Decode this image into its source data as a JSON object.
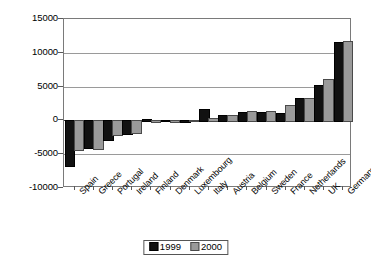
{
  "chart_data": {
    "type": "bar",
    "title": "",
    "subtitle": "",
    "xlabel": "",
    "ylabel": "",
    "ylim": [
      -10000,
      15000
    ],
    "yticks": [
      15000,
      10000,
      5000,
      0,
      -5000,
      -10000
    ],
    "ytick_labels": [
      "15000",
      "10000",
      "5000",
      "0",
      "-5000",
      "-10000"
    ],
    "grid": true,
    "legend_position": "bottom-center",
    "orientation": "vertical",
    "categories": [
      "Spain",
      "Greece",
      "Portugal",
      "Ireland",
      "Finland",
      "Denmark",
      "Luxembourg",
      "Italy",
      "Austria",
      "Belgium",
      "Sweden",
      "France",
      "Netherlands",
      "UK",
      "Germany"
    ],
    "series": [
      {
        "name": "1999",
        "color": "#111111",
        "values": [
          -6550,
          -4000,
          -2700,
          -1800,
          250,
          100,
          80,
          1700,
          800,
          1300,
          1250,
          1150,
          3300,
          5300,
          11550
        ]
      },
      {
        "name": "2000",
        "color": "#9a9a9a",
        "values": [
          -4300,
          -4150,
          -2000,
          -1700,
          -150,
          -60,
          120,
          300,
          800,
          1400,
          1400,
          2350,
          3300,
          6200,
          11800
        ]
      }
    ]
  },
  "legend": {
    "entries": [
      {
        "label": "1999"
      },
      {
        "label": "2000"
      }
    ]
  },
  "colors": {
    "series_1999": "#111111",
    "series_2000": "#9a9a9a",
    "axis": "#7a7a7a",
    "gridline": "#9a9a9a",
    "background": "#ffffff"
  }
}
